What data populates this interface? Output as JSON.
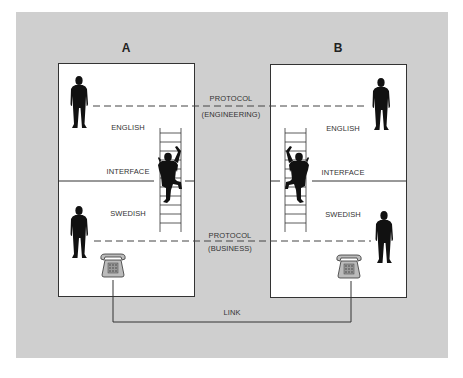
{
  "diagram": {
    "title_a": "A",
    "title_b": "B",
    "protocol_top": {
      "label": "PROTOCOL",
      "sublabel": "(ENGINEERING)"
    },
    "protocol_bottom": {
      "label": "PROTOCOL",
      "sublabel": "(BUSINESS)"
    },
    "link_label": "LINK",
    "box_a": {
      "upper_label": "ENGLISH",
      "interface_label": "INTERFACE",
      "lower_label": "SWEDISH"
    },
    "box_b": {
      "upper_label": "ENGLISH",
      "interface_label": "INTERFACE",
      "lower_label": "SWEDISH"
    },
    "icons": {
      "person_standing": "person-silhouette",
      "climber": "person-climbing-ladder",
      "ladder": "ladder",
      "telephone": "desk-telephone"
    },
    "colors": {
      "background": "#cfcfcf",
      "panel": "#ffffff",
      "ink": "#111111",
      "line": "#333333"
    }
  }
}
